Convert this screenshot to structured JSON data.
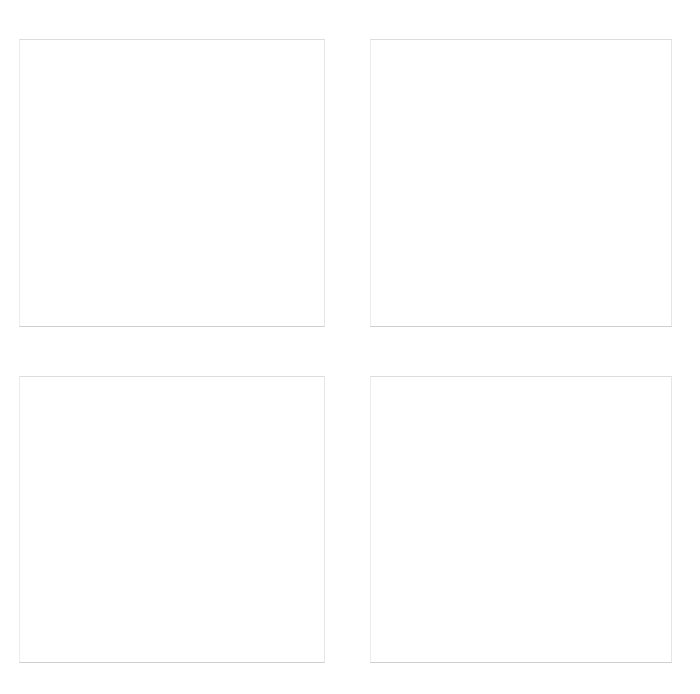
{
  "layout": {
    "grid": "2x2",
    "background_color": "#ffffff",
    "border_color": "#dcdcdc"
  },
  "panels": [
    {
      "id": "top-left",
      "label": "",
      "x": 19,
      "y": 39,
      "width": 306,
      "height": 288
    },
    {
      "id": "top-right",
      "label": "",
      "x": 370,
      "y": 39,
      "width": 302,
      "height": 288
    },
    {
      "id": "bottom-left",
      "label": "",
      "x": 19,
      "y": 376,
      "width": 306,
      "height": 287
    },
    {
      "id": "bottom-right",
      "label": "",
      "x": 370,
      "y": 376,
      "width": 302,
      "height": 287
    }
  ]
}
